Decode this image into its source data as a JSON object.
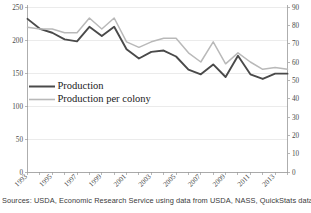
{
  "source_note": "Sources: USDA, Economic Research Service using data from USDA, NASS, QuickStats data.",
  "colors": {
    "production": "#4a4a4a",
    "production_per_colony": "#b9b9b9",
    "axis": "#9a9a9a",
    "grid": "#e2e2e2",
    "text": "#1a1a1a",
    "background": "#ffffff"
  },
  "legend": {
    "production_label": "Production",
    "per_colony_label": "Production per colony"
  },
  "axes": {
    "left_ticks": [
      "0",
      "50",
      "100",
      "150",
      "200",
      "250"
    ],
    "right_ticks": [
      "0",
      "10",
      "20",
      "30",
      "40",
      "50",
      "60",
      "70",
      "80",
      "90"
    ],
    "x_ticks": [
      "1993",
      "1995",
      "1997",
      "1999",
      "2001",
      "2003",
      "2005",
      "2007",
      "2009",
      "2011",
      "2013"
    ]
  },
  "chart_data": {
    "type": "line",
    "title": "",
    "subtitle": "",
    "xlabel": "",
    "ylabel": "",
    "y2label": "",
    "xlim": [
      1993,
      2014
    ],
    "ylim": [
      0,
      250
    ],
    "y2lim": [
      0,
      90
    ],
    "grid": true,
    "legend_position": "inside-left",
    "x": [
      1993,
      1994,
      1995,
      1996,
      1997,
      1998,
      1999,
      2000,
      2001,
      2002,
      2003,
      2004,
      2005,
      2006,
      2007,
      2008,
      2009,
      2010,
      2011,
      2012,
      2013,
      2014
    ],
    "series": [
      {
        "name": "Production",
        "axis": "left",
        "color": "#4a4a4a",
        "values": [
          232,
          217,
          211,
          201,
          198,
          220,
          206,
          220,
          186,
          172,
          182,
          184,
          175,
          155,
          148,
          163,
          144,
          176,
          148,
          141,
          149,
          149
        ]
      },
      {
        "name": "Production per colony",
        "axis": "right",
        "color": "#b9b9b9",
        "values": [
          79,
          78,
          78,
          76,
          76,
          84,
          78,
          84,
          71,
          68,
          71,
          73,
          73,
          65,
          60,
          71,
          59,
          65,
          60,
          56,
          57,
          56
        ]
      }
    ],
    "annotations": [
      "Sources: USDA, Economic Research Service using data from USDA, NASS, QuickStats data."
    ]
  }
}
